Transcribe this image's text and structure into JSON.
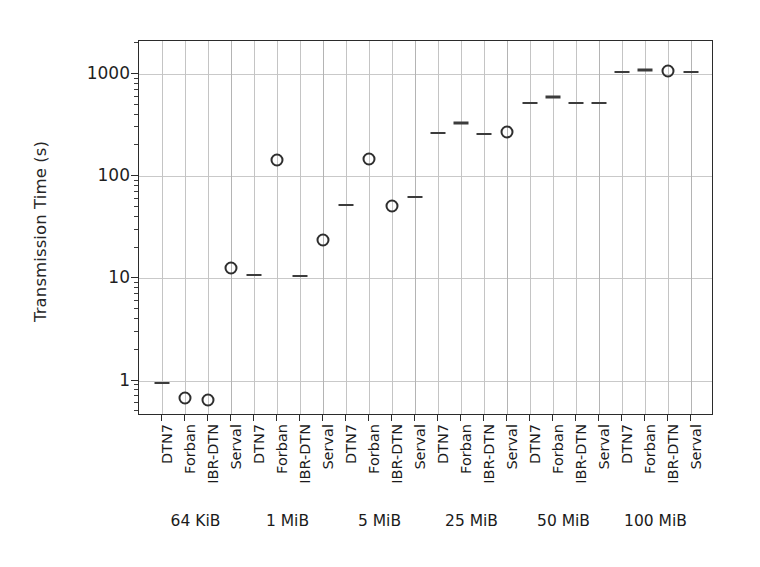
{
  "chart_data": {
    "type": "scatter",
    "title": "",
    "xlabel": "",
    "ylabel": "Transmission Time (s)",
    "yscale": "log",
    "ylim": [
      0.45,
      2100
    ],
    "grid": true,
    "legend": "none",
    "y_tick_labels": [
      "1000",
      "100",
      "10",
      "1"
    ],
    "y_tick_values": [
      1000,
      100,
      10,
      1
    ],
    "protocols": [
      "DTN7",
      "Forban",
      "IBR-DTN",
      "Serval"
    ],
    "group_labels": [
      "64 KiB",
      "1 MiB",
      "5 MiB",
      "25 MiB",
      "50 MiB",
      "100 MiB"
    ],
    "categories": [
      "64 KiB / DTN7",
      "64 KiB / Forban",
      "64 KiB / IBR-DTN",
      "64 KiB / Serval",
      "1 MiB / DTN7",
      "1 MiB / Forban",
      "1 MiB / IBR-DTN",
      "1 MiB / Serval",
      "5 MiB / DTN7",
      "5 MiB / Forban",
      "5 MiB / IBR-DTN",
      "5 MiB / Serval",
      "25 MiB / DTN7",
      "25 MiB / Forban",
      "25 MiB / IBR-DTN",
      "25 MiB / Serval",
      "50 MiB / DTN7",
      "50 MiB / Forban",
      "50 MiB / IBR-DTN",
      "50 MiB / Serval",
      "100 MiB / DTN7",
      "100 MiB / Forban",
      "100 MiB / IBR-DTN",
      "100 MiB / Serval"
    ],
    "groups": [
      {
        "label": "64 KiB",
        "points": [
          {
            "protocol": "DTN7",
            "value": 0.95,
            "marker": "line"
          },
          {
            "protocol": "Forban",
            "value": 0.68,
            "marker": "circle"
          },
          {
            "protocol": "IBR-DTN",
            "value": 0.64,
            "marker": "circle"
          },
          {
            "protocol": "Serval",
            "value": 12.5,
            "marker": "circle"
          }
        ]
      },
      {
        "label": "1 MiB",
        "points": [
          {
            "protocol": "DTN7",
            "value": 10.7,
            "marker": "line"
          },
          {
            "protocol": "Forban",
            "value": 145,
            "marker": "circle"
          },
          {
            "protocol": "IBR-DTN",
            "value": 10.5,
            "marker": "line"
          },
          {
            "protocol": "Serval",
            "value": 23.5,
            "marker": "circle"
          }
        ]
      },
      {
        "label": "5 MiB",
        "points": [
          {
            "protocol": "DTN7",
            "value": 52,
            "marker": "line"
          },
          {
            "protocol": "Forban",
            "value": 148,
            "marker": "circle"
          },
          {
            "protocol": "IBR-DTN",
            "value": 51,
            "marker": "circle"
          },
          {
            "protocol": "Serval",
            "value": 63,
            "marker": "line"
          }
        ]
      },
      {
        "label": "25 MiB",
        "points": [
          {
            "protocol": "DTN7",
            "value": 262,
            "marker": "line"
          },
          {
            "protocol": "Forban",
            "value": 330,
            "marker": "line"
          },
          {
            "protocol": "IBR-DTN",
            "value": 258,
            "marker": "line"
          },
          {
            "protocol": "Serval",
            "value": 272,
            "marker": "circle"
          }
        ]
      },
      {
        "label": "50 MiB",
        "points": [
          {
            "protocol": "DTN7",
            "value": 520,
            "marker": "line"
          },
          {
            "protocol": "Forban",
            "value": 600,
            "marker": "line"
          },
          {
            "protocol": "IBR-DTN",
            "value": 515,
            "marker": "line"
          },
          {
            "protocol": "Serval",
            "value": 515,
            "marker": "line"
          }
        ]
      },
      {
        "label": "100 MiB",
        "points": [
          {
            "protocol": "DTN7",
            "value": 1040,
            "marker": "line"
          },
          {
            "protocol": "Forban",
            "value": 1090,
            "marker": "line"
          },
          {
            "protocol": "IBR-DTN",
            "value": 1070,
            "marker": "circle"
          },
          {
            "protocol": "Serval",
            "value": 1040,
            "marker": "line"
          }
        ]
      }
    ],
    "colors": {
      "marker": "#2e2e2e",
      "grid": "#c9c9c9",
      "frame": "#2b2b2b",
      "background": "#ffffff",
      "text": "#1b1b1b"
    }
  }
}
